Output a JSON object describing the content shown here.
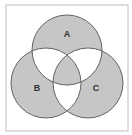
{
  "diagram": {
    "type": "venn-3",
    "frame": {
      "x": 6,
      "y": 5,
      "width": 122,
      "height": 126,
      "stroke": "#bdbdbd",
      "fill": "#ffffff"
    },
    "colors": {
      "shaded": "#c6c6c6",
      "unshaded": "#ffffff",
      "stroke": "#555555"
    },
    "circles": [
      {
        "id": "A",
        "label": "A",
        "cx": 67,
        "cy": 50,
        "r": 35,
        "label_x": 67,
        "label_y": 35
      },
      {
        "id": "B",
        "label": "B",
        "cx": 46,
        "cy": 83,
        "r": 35,
        "label_x": 37,
        "label_y": 89
      },
      {
        "id": "C",
        "label": "C",
        "cx": 88,
        "cy": 83,
        "r": 35,
        "label_x": 96,
        "label_y": 89
      }
    ],
    "shaded_regions": [
      "A only",
      "B only",
      "C only",
      "A∩B∩C"
    ],
    "unshaded_regions": [
      "A∩B only",
      "A∩C only",
      "B∩C only"
    ]
  }
}
